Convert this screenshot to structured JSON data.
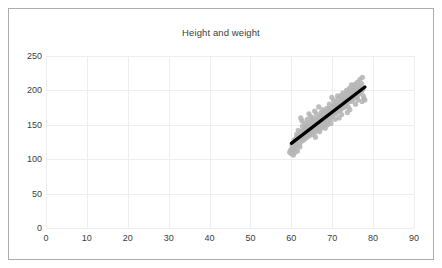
{
  "chart_data": {
    "type": "scatter",
    "title": "Height and weight",
    "xlabel": "",
    "ylabel": "",
    "xlim": [
      0,
      90
    ],
    "ylim": [
      0,
      250
    ],
    "xticks": [
      0,
      10,
      20,
      30,
      40,
      50,
      60,
      70,
      80,
      90
    ],
    "yticks": [
      0,
      50,
      100,
      150,
      200,
      250
    ],
    "grid": true,
    "legend": false,
    "marker_color": "#b5b5b5",
    "trendline_color": "#000000",
    "trendline": {
      "x": [
        60,
        78
      ],
      "y": [
        123,
        205
      ]
    },
    "points": [
      [
        59.6,
        110
      ],
      [
        59.8,
        113
      ],
      [
        60.0,
        108
      ],
      [
        60.1,
        115
      ],
      [
        60.3,
        112
      ],
      [
        60.4,
        118
      ],
      [
        60.5,
        106
      ],
      [
        60.6,
        121
      ],
      [
        60.8,
        114
      ],
      [
        60.9,
        110
      ],
      [
        61.0,
        125
      ],
      [
        61.1,
        117
      ],
      [
        61.2,
        131
      ],
      [
        61.4,
        120
      ],
      [
        61.5,
        112
      ],
      [
        61.6,
        128
      ],
      [
        61.8,
        135
      ],
      [
        62.0,
        122
      ],
      [
        62.1,
        118
      ],
      [
        62.2,
        140
      ],
      [
        62.4,
        130
      ],
      [
        62.5,
        126
      ],
      [
        62.6,
        156
      ],
      [
        62.8,
        134
      ],
      [
        63.0,
        128
      ],
      [
        63.1,
        142
      ],
      [
        63.2,
        136
      ],
      [
        63.4,
        130
      ],
      [
        63.5,
        148
      ],
      [
        63.6,
        138
      ],
      [
        63.8,
        132
      ],
      [
        64.0,
        145
      ],
      [
        64.1,
        139
      ],
      [
        64.2,
        152
      ],
      [
        64.4,
        134
      ],
      [
        64.5,
        143
      ],
      [
        64.6,
        137
      ],
      [
        64.8,
        150
      ],
      [
        65.0,
        141
      ],
      [
        65.1,
        147
      ],
      [
        65.2,
        136
      ],
      [
        65.4,
        155
      ],
      [
        65.5,
        144
      ],
      [
        65.6,
        150
      ],
      [
        65.8,
        139
      ],
      [
        66.0,
        148
      ],
      [
        66.1,
        158
      ],
      [
        66.2,
        143
      ],
      [
        66.4,
        152
      ],
      [
        66.5,
        146
      ],
      [
        66.6,
        161
      ],
      [
        66.8,
        150
      ],
      [
        67.0,
        155
      ],
      [
        67.1,
        144
      ],
      [
        67.2,
        163
      ],
      [
        67.4,
        152
      ],
      [
        67.5,
        158
      ],
      [
        67.6,
        147
      ],
      [
        67.8,
        166
      ],
      [
        68.0,
        156
      ],
      [
        68.1,
        161
      ],
      [
        68.2,
        150
      ],
      [
        68.4,
        170
      ],
      [
        68.5,
        159
      ],
      [
        68.6,
        165
      ],
      [
        68.8,
        154
      ],
      [
        69.0,
        168
      ],
      [
        69.1,
        160
      ],
      [
        69.2,
        174
      ],
      [
        69.4,
        163
      ],
      [
        69.5,
        157
      ],
      [
        69.6,
        171
      ],
      [
        69.8,
        166
      ],
      [
        70.0,
        176
      ],
      [
        70.1,
        162
      ],
      [
        70.2,
        170
      ],
      [
        70.4,
        180
      ],
      [
        70.5,
        167
      ],
      [
        70.6,
        175
      ],
      [
        70.8,
        171
      ],
      [
        71.0,
        183
      ],
      [
        71.1,
        169
      ],
      [
        71.2,
        178
      ],
      [
        71.4,
        173
      ],
      [
        71.5,
        188
      ],
      [
        71.6,
        176
      ],
      [
        71.8,
        181
      ],
      [
        72.0,
        172
      ],
      [
        72.1,
        192
      ],
      [
        72.2,
        179
      ],
      [
        72.4,
        185
      ],
      [
        72.5,
        174
      ],
      [
        72.6,
        196
      ],
      [
        72.8,
        183
      ],
      [
        73.0,
        189
      ],
      [
        73.1,
        177
      ],
      [
        73.2,
        194
      ],
      [
        73.4,
        186
      ],
      [
        73.5,
        200
      ],
      [
        73.6,
        181
      ],
      [
        73.8,
        191
      ],
      [
        74.0,
        197
      ],
      [
        74.1,
        185
      ],
      [
        74.2,
        203
      ],
      [
        74.4,
        190
      ],
      [
        74.5,
        196
      ],
      [
        74.6,
        184
      ],
      [
        74.8,
        201
      ],
      [
        75.0,
        194
      ],
      [
        75.1,
        188
      ],
      [
        75.2,
        206
      ],
      [
        75.4,
        199
      ],
      [
        75.5,
        192
      ],
      [
        75.6,
        209
      ],
      [
        75.8,
        197
      ],
      [
        76.0,
        203
      ],
      [
        76.1,
        190
      ],
      [
        76.2,
        212
      ],
      [
        76.4,
        200
      ],
      [
        76.5,
        206
      ],
      [
        76.6,
        195
      ],
      [
        76.8,
        216
      ],
      [
        77.0,
        204
      ],
      [
        77.1,
        198
      ],
      [
        77.2,
        210
      ],
      [
        77.4,
        219
      ],
      [
        77.5,
        202
      ],
      [
        77.6,
        192
      ],
      [
        77.8,
        188
      ],
      [
        78.0,
        186
      ],
      [
        62.3,
        160
      ],
      [
        63.9,
        158
      ],
      [
        64.7,
        162
      ],
      [
        66.9,
        140
      ],
      [
        68.3,
        145
      ],
      [
        70.7,
        158
      ],
      [
        72.3,
        165
      ],
      [
        74.3,
        172
      ],
      [
        61.7,
        142
      ],
      [
        65.9,
        132
      ],
      [
        67.7,
        172
      ],
      [
        69.7,
        152
      ],
      [
        71.7,
        160
      ],
      [
        73.7,
        168
      ],
      [
        75.7,
        180
      ],
      [
        60.7,
        128
      ],
      [
        62.7,
        148
      ],
      [
        64.9,
        156
      ],
      [
        66.3,
        154
      ],
      [
        68.7,
        174
      ],
      [
        70.3,
        186
      ],
      [
        72.7,
        188
      ],
      [
        74.7,
        208
      ],
      [
        76.3,
        186
      ],
      [
        63.3,
        152
      ],
      [
        65.3,
        160
      ],
      [
        67.3,
        168
      ],
      [
        69.3,
        180
      ],
      [
        71.3,
        192
      ],
      [
        73.3,
        182
      ],
      [
        75.3,
        202
      ],
      [
        61.3,
        136
      ],
      [
        64.3,
        166
      ],
      [
        66.7,
        176
      ],
      [
        68.9,
        150
      ],
      [
        70.9,
        166
      ],
      [
        72.9,
        176
      ],
      [
        74.9,
        186
      ],
      [
        76.7,
        198
      ],
      [
        60.2,
        120
      ],
      [
        62.9,
        142
      ],
      [
        65.7,
        170
      ],
      [
        67.9,
        158
      ],
      [
        69.9,
        190
      ],
      [
        71.9,
        170
      ],
      [
        73.9,
        176
      ],
      [
        75.9,
        192
      ],
      [
        77.3,
        184
      ],
      [
        63.7,
        146
      ],
      [
        66.1,
        166
      ]
    ]
  }
}
